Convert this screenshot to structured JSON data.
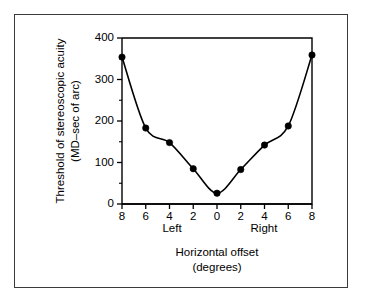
{
  "figure": {
    "background_color": "#ffffff",
    "frame_color": "#3a3a3a",
    "ink_color": "#000000"
  },
  "axes": {
    "y_title_line1": "Threshold of stereoscopic acuity",
    "y_title_line2": "(MD–sec of arc)",
    "x_title_line1": "Horizontal offset",
    "x_title_line2": "(degrees)",
    "x_side_left": "Left",
    "x_side_right": "Right",
    "y_ticks": [
      "0",
      "100",
      "200",
      "300",
      "400"
    ],
    "x_ticks": [
      "8",
      "6",
      "4",
      "2",
      "0",
      "2",
      "4",
      "6",
      "8"
    ]
  },
  "chart_data": {
    "type": "line",
    "title": "",
    "subtitle": "",
    "xlabel": "Horizontal offset (degrees)",
    "ylabel": "Threshold of stereoscopic acuity (MD–sec of arc)",
    "xlim": [
      -8,
      8
    ],
    "ylim": [
      0,
      400
    ],
    "grid": false,
    "legend": "none",
    "y_tick_values": [
      0,
      100,
      200,
      300,
      400
    ],
    "y_minor_tick_values": [
      50,
      150,
      250,
      350
    ],
    "x_tick_values": [
      -8,
      -6,
      -4,
      -2,
      0,
      2,
      4,
      6,
      8
    ],
    "x_tick_labels": [
      "8",
      "6",
      "4",
      "2",
      "0",
      "2",
      "4",
      "6",
      "8"
    ],
    "x_axis_side_annotations": [
      {
        "text": "Left",
        "x": -5
      },
      {
        "text": "Right",
        "x": 5
      }
    ],
    "marker": "filled-circle",
    "series": [
      {
        "name": "Stereoacuity threshold",
        "x": [
          -8,
          -6,
          -4,
          -2,
          0,
          2,
          4,
          6,
          8
        ],
        "values": [
          354,
          183,
          148,
          85,
          26,
          83,
          142,
          188,
          359
        ],
        "points": [
          {
            "x": -8,
            "x_label": "Left 8",
            "y": 354
          },
          {
            "x": -6,
            "x_label": "Left 6",
            "y": 183
          },
          {
            "x": -4,
            "x_label": "Left 4",
            "y": 148
          },
          {
            "x": -2,
            "x_label": "Left 2",
            "y": 85
          },
          {
            "x": 0,
            "x_label": "0",
            "y": 26
          },
          {
            "x": 2,
            "x_label": "Right 2",
            "y": 83
          },
          {
            "x": 4,
            "x_label": "Right 4",
            "y": 142
          },
          {
            "x": 6,
            "x_label": "Right 6",
            "y": 188
          },
          {
            "x": 8,
            "x_label": "Right 8",
            "y": 359
          }
        ]
      }
    ]
  }
}
